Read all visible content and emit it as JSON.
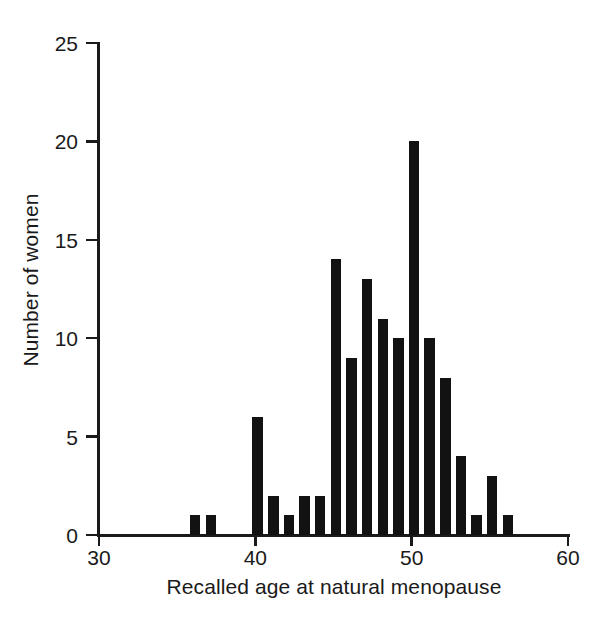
{
  "chart_data": {
    "type": "bar",
    "title": "",
    "subtitle": "",
    "xlabel": "Recalled age at natural menopause",
    "ylabel": "Number of women",
    "xlim": [
      30,
      60
    ],
    "ylim": [
      0,
      25
    ],
    "xticks": [
      30,
      40,
      50,
      60
    ],
    "yticks": [
      0,
      5,
      10,
      15,
      20,
      25
    ],
    "xtick_labels": [
      "30",
      "40",
      "50",
      "60"
    ],
    "ytick_labels": [
      "0",
      "5",
      "10",
      "15",
      "20",
      "25"
    ],
    "grid": false,
    "legend": null,
    "bar_color": "#121212",
    "bin_width": 1,
    "categories": [
      36,
      37,
      40,
      41,
      42,
      43,
      44,
      45,
      46,
      47,
      48,
      49,
      50,
      51,
      52,
      53,
      54,
      55,
      56
    ],
    "values": [
      1,
      1,
      6,
      2,
      1,
      2,
      2,
      14,
      9,
      13,
      11,
      10,
      20,
      10,
      8,
      4,
      1,
      3,
      1
    ],
    "bars": [
      {
        "x": 36,
        "value": 1
      },
      {
        "x": 37,
        "value": 1
      },
      {
        "x": 40,
        "value": 6
      },
      {
        "x": 41,
        "value": 2
      },
      {
        "x": 42,
        "value": 1
      },
      {
        "x": 43,
        "value": 2
      },
      {
        "x": 44,
        "value": 2
      },
      {
        "x": 45,
        "value": 14
      },
      {
        "x": 46,
        "value": 9
      },
      {
        "x": 47,
        "value": 13
      },
      {
        "x": 48,
        "value": 11
      },
      {
        "x": 49,
        "value": 10
      },
      {
        "x": 50,
        "value": 20
      },
      {
        "x": 51,
        "value": 10
      },
      {
        "x": 52,
        "value": 8
      },
      {
        "x": 53,
        "value": 4
      },
      {
        "x": 54,
        "value": 1
      },
      {
        "x": 55,
        "value": 3
      },
      {
        "x": 56,
        "value": 1
      }
    ]
  },
  "axes": {
    "x_label": "Recalled age at natural menopause",
    "y_label": "Number of women"
  }
}
